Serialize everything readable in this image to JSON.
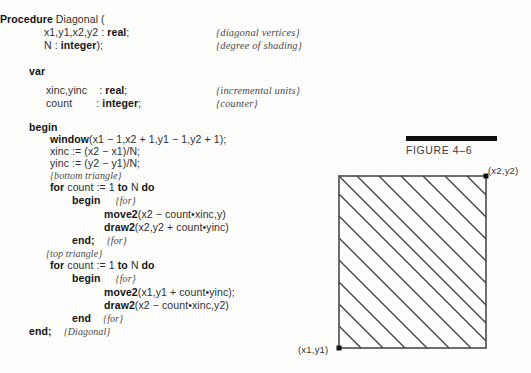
{
  "document": {
    "kind": "textbook-page-scan",
    "listing": {
      "lines": [
        {
          "indent": 0,
          "segments": [
            {
              "t": "Procedure ",
              "b": true
            },
            {
              "t": "Diagonal (",
              "b": false
            }
          ]
        },
        {
          "indent": 44,
          "segments": [
            {
              "t": "x1,y1,x2,y2 : ",
              "b": false
            },
            {
              "t": "real",
              "b": true
            },
            {
              "t": ";",
              "b": false
            }
          ]
        },
        {
          "indent": 44,
          "segments": [
            {
              "t": "N : ",
              "b": false
            },
            {
              "t": "integer",
              "b": true
            },
            {
              "t": ");",
              "b": false
            }
          ]
        },
        {
          "indent": 29,
          "segments": [
            {
              "t": "var",
              "b": true
            }
          ]
        },
        {
          "indent": 46,
          "segments": [
            {
              "t": "xinc,yinc    : ",
              "b": false
            },
            {
              "t": "real",
              "b": true
            },
            {
              "t": ";",
              "b": false
            }
          ]
        },
        {
          "indent": 46,
          "segments": [
            {
              "t": "count        : ",
              "b": false
            },
            {
              "t": "integer",
              "b": true
            },
            {
              "t": ";",
              "b": false
            }
          ]
        },
        {
          "indent": 29,
          "segments": [
            {
              "t": "begin",
              "b": true
            }
          ]
        },
        {
          "indent": 50,
          "segments": [
            {
              "t": "window",
              "b": true
            },
            {
              "t": "(x1 − 1,x2 + 1,y1 − 1,y2 + 1);",
              "b": false
            }
          ]
        },
        {
          "indent": 50,
          "segments": [
            {
              "t": "xinc := (x2 − x1)/N;",
              "b": false
            }
          ]
        },
        {
          "indent": 50,
          "segments": [
            {
              "t": "yinc := (y2 − y1)/N;",
              "b": false
            }
          ]
        },
        {
          "indent": 50,
          "segments": [
            {
              "t": "{bottom triangle}",
              "b": false,
              "i": true
            }
          ]
        },
        {
          "indent": 50,
          "segments": [
            {
              "t": "for ",
              "b": true
            },
            {
              "t": "count := 1 ",
              "b": false
            },
            {
              "t": "to ",
              "b": true
            },
            {
              "t": "N ",
              "b": false
            },
            {
              "t": "do",
              "b": true
            }
          ]
        },
        {
          "indent": 72,
          "segments": [
            {
              "t": "begin",
              "b": true
            },
            {
              "t": "     ",
              "b": false
            },
            {
              "t": "{for}",
              "b": false,
              "i": true
            }
          ]
        },
        {
          "indent": 104,
          "segments": [
            {
              "t": "move2",
              "b": true
            },
            {
              "t": "(x2 − count•xinc,y)",
              "b": false
            }
          ]
        },
        {
          "indent": 104,
          "segments": [
            {
              "t": "draw2",
              "b": true
            },
            {
              "t": "(x2,y2 + count•yinc)",
              "b": false
            }
          ]
        },
        {
          "indent": 72,
          "segments": [
            {
              "t": "end;",
              "b": true
            },
            {
              "t": "    ",
              "b": false
            },
            {
              "t": "{for}",
              "b": false,
              "i": true
            }
          ]
        },
        {
          "indent": 46,
          "segments": [
            {
              "t": "{top triangle}",
              "b": false,
              "i": true
            }
          ]
        },
        {
          "indent": 50,
          "segments": [
            {
              "t": "for ",
              "b": true
            },
            {
              "t": "count := 1 ",
              "b": false
            },
            {
              "t": "to ",
              "b": true
            },
            {
              "t": "N ",
              "b": false
            },
            {
              "t": "do",
              "b": true
            }
          ]
        },
        {
          "indent": 72,
          "segments": [
            {
              "t": "begin",
              "b": true
            },
            {
              "t": "     ",
              "b": false
            },
            {
              "t": "{for}",
              "b": false,
              "i": true
            }
          ]
        },
        {
          "indent": 104,
          "segments": [
            {
              "t": "move2",
              "b": true
            },
            {
              "t": "(x1,y1 + count•yinc);",
              "b": false
            }
          ]
        },
        {
          "indent": 104,
          "segments": [
            {
              "t": "draw2",
              "b": true
            },
            {
              "t": "(x2 − count•xinc,y2)",
              "b": false
            }
          ]
        },
        {
          "indent": 72,
          "segments": [
            {
              "t": "end",
              "b": true
            },
            {
              "t": "    ",
              "b": false
            },
            {
              "t": "{for}",
              "b": false,
              "i": true
            }
          ]
        },
        {
          "indent": 29,
          "segments": [
            {
              "t": "end;",
              "b": true
            },
            {
              "t": "    ",
              "b": false
            },
            {
              "t": "{Diagonal}",
              "b": false,
              "i": true
            }
          ]
        }
      ],
      "line_tops": [
        14,
        27,
        40,
        66,
        85,
        98,
        122,
        134,
        146,
        158,
        170,
        182,
        195,
        209,
        222,
        235,
        248,
        260,
        273,
        287,
        300,
        313,
        326
      ],
      "side_comments": [
        {
          "text": "{diagonal vertices}",
          "left": 216,
          "top": 27
        },
        {
          "text": "{degree of shading}",
          "left": 216,
          "top": 40
        },
        {
          "text": "{incremental units}",
          "left": 216,
          "top": 85
        },
        {
          "text": "{counter}",
          "left": 216,
          "top": 98
        }
      ]
    },
    "figure": {
      "caption": "FIGURE 4–6",
      "bar_color": "#100f0d",
      "label_top_right": "(x2,y2)",
      "label_bottom_left": "(x1,y1)",
      "rect": {
        "x": 49,
        "y": 51,
        "width": 147,
        "height": 172
      },
      "stroke_color": "#4a4a4a",
      "hatch_color": "#3c3c3c",
      "vertex_dot_color": "#111111",
      "hatch_segments": [
        {
          "x1": 49,
          "y1": 201,
          "x2": 71,
          "y2": 223
        },
        {
          "x1": 49,
          "y1": 179,
          "x2": 93,
          "y2": 223
        },
        {
          "x1": 49,
          "y1": 157,
          "x2": 115,
          "y2": 223
        },
        {
          "x1": 49,
          "y1": 135,
          "x2": 137,
          "y2": 223
        },
        {
          "x1": 49,
          "y1": 113,
          "x2": 159,
          "y2": 223
        },
        {
          "x1": 49,
          "y1": 91,
          "x2": 181,
          "y2": 223
        },
        {
          "x1": 49,
          "y1": 69,
          "x2": 196,
          "y2": 216
        },
        {
          "x1": 49,
          "y1": 51,
          "x2": 196,
          "y2": 198
        },
        {
          "x1": 67,
          "y1": 51,
          "x2": 196,
          "y2": 180
        },
        {
          "x1": 89,
          "y1": 51,
          "x2": 196,
          "y2": 158
        },
        {
          "x1": 111,
          "y1": 51,
          "x2": 196,
          "y2": 136
        },
        {
          "x1": 133,
          "y1": 51,
          "x2": 196,
          "y2": 114
        },
        {
          "x1": 155,
          "y1": 51,
          "x2": 196,
          "y2": 92
        },
        {
          "x1": 177,
          "y1": 51,
          "x2": 196,
          "y2": 70
        }
      ]
    }
  }
}
